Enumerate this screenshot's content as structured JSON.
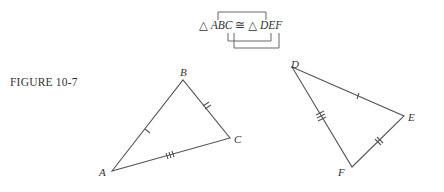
{
  "figure": {
    "label": "FIGURE 10-7",
    "statement": {
      "tri1_symbol": "△",
      "tri1_name": "ABC",
      "congruent_symbol": "≅",
      "tri2_symbol": "△",
      "tri2_name": "DEF",
      "correspondence": [
        [
          "A",
          "D"
        ],
        [
          "B",
          "E"
        ],
        [
          "C",
          "F"
        ]
      ]
    },
    "triangle1": {
      "vertices": {
        "A": "A",
        "B": "B",
        "C": "C"
      },
      "tick_marks": {
        "AB": 1,
        "BC": 2,
        "CA": 3
      }
    },
    "triangle2": {
      "vertices": {
        "D": "D",
        "E": "E",
        "F": "F"
      },
      "tick_marks": {
        "DE": 1,
        "EF": 2,
        "FD": 3
      }
    },
    "stroke_color": "#555555"
  }
}
